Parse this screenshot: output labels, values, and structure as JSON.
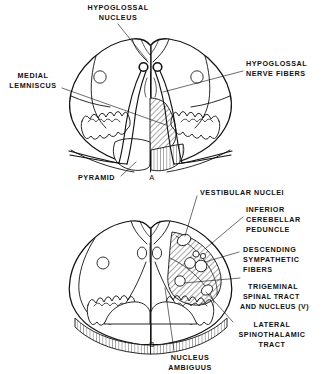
{
  "figure": {
    "background_color": "#ffffff",
    "ink_color": "#111111",
    "width": 325,
    "height": 374
  },
  "panels": [
    {
      "id": "A",
      "letter": "A",
      "name": "upper-medulla-section",
      "description": "Cross section of medulla at level of hypoglossal nucleus"
    },
    {
      "id": "B",
      "letter": "B",
      "name": "lower-medulla-section",
      "description": "Cross section of medulla at level of vestibular nuclei"
    }
  ],
  "labels_panel_a": [
    {
      "id": "hypoglossal-nucleus",
      "lines": [
        "HYPOGLOSSAL",
        "NUCLEUS"
      ],
      "align": "middle"
    },
    {
      "id": "medial-lemniscus",
      "lines": [
        "MEDIAL",
        "LEMNISCUS"
      ],
      "align": "middle"
    },
    {
      "id": "hypoglossal-nerve-fibers",
      "lines": [
        "HYPOGLOSSAL",
        "NERVE FIBERS"
      ],
      "align": "start"
    },
    {
      "id": "pyramid",
      "lines": [
        "PYRAMID"
      ],
      "align": "start"
    }
  ],
  "labels_panel_b": [
    {
      "id": "vestibular-nuclei",
      "lines": [
        "VESTIBULAR NUCLEI"
      ],
      "align": "start"
    },
    {
      "id": "inferior-cerebellar-peduncle",
      "lines": [
        "INFERIOR",
        "CEREBELLAR",
        "PEDUNCLE"
      ],
      "align": "start"
    },
    {
      "id": "descending-sympathetic-fibers",
      "lines": [
        "DESCENDING",
        "SYMPATHETIC",
        "FIBERS"
      ],
      "align": "start"
    },
    {
      "id": "trigeminal-spinal-tract-and-nucleus",
      "lines": [
        "TRIGEMINAL",
        "SPINAL  TRACT",
        "AND  NUCLEUS (V)"
      ],
      "align": "start"
    },
    {
      "id": "lateral-spinothalamic-tract",
      "lines": [
        "LATERAL",
        "SPINOTHALAMIC",
        "TRACT"
      ],
      "align": "middle"
    },
    {
      "id": "nucleus-ambiguus",
      "lines": [
        "NUCLEUS",
        "AMBIGUUS"
      ],
      "align": "middle"
    }
  ],
  "text": {
    "hypoglossal_nucleus_l1": "HYPOGLOSSAL",
    "hypoglossal_nucleus_l2": "NUCLEUS",
    "medial_lemniscus_l1": "MEDIAL",
    "medial_lemniscus_l2": "LEMNISCUS",
    "hypoglossal_nerve_fibers_l1": "HYPOGLOSSAL",
    "hypoglossal_nerve_fibers_l2": "NERVE FIBERS",
    "pyramid": "PYRAMID",
    "panel_a_letter": "A",
    "vestibular_nuclei": "VESTIBULAR NUCLEI",
    "inferior_cerebellar_peduncle_l1": "INFERIOR",
    "inferior_cerebellar_peduncle_l2": "CEREBELLAR",
    "inferior_cerebellar_peduncle_l3": "PEDUNCLE",
    "descending_sympathetic_fibers_l1": "DESCENDING",
    "descending_sympathetic_fibers_l2": "SYMPATHETIC",
    "descending_sympathetic_fibers_l3": "FIBERS",
    "trigeminal_l1": "TRIGEMINAL",
    "trigeminal_l2": "SPINAL  TRACT",
    "trigeminal_l3": "AND  NUCLEUS (V)",
    "lateral_spinothalamic_l1": "LATERAL",
    "lateral_spinothalamic_l2": "SPINOTHALAMIC",
    "lateral_spinothalamic_l3": "TRACT",
    "nucleus_ambiguus_l1": "NUCLEUS",
    "nucleus_ambiguus_l2": "AMBIGUUS",
    "panel_b_letter": "B"
  }
}
